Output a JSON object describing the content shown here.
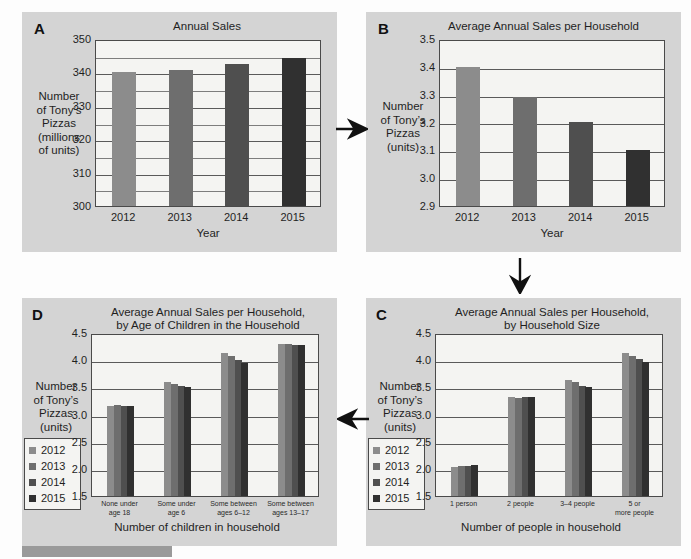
{
  "figure": {
    "background": "#fdfdfd",
    "panel_background": "#d4d4d4",
    "plot_background": "#f4f4f2",
    "series_colors": [
      "#8c8c8c",
      "#6e6e6e",
      "#4f4f4f",
      "#303030"
    ],
    "legend_years": [
      "2012",
      "2013",
      "2014",
      "2015"
    ],
    "ylabel_A": "Number\nof Tony’s\nPizzas\n(millions\nof units)",
    "ylabel_common": "Number\nof Tony’s\nPizzas\n(units)"
  },
  "panels": {
    "A": {
      "label": "A",
      "title": "Annual Sales",
      "ylabel_lines": [
        "Number",
        "of Tony’s",
        "Pizzas",
        "(millions",
        "of units)"
      ],
      "xlabel": "Year"
    },
    "B": {
      "label": "B",
      "title": "Average Annual Sales per Household",
      "ylabel_lines": [
        "Number",
        "of Tony’s",
        "Pizzas",
        "(units)"
      ],
      "xlabel": "Year"
    },
    "C": {
      "label": "C",
      "title_lines": [
        "Average Annual Sales per Household,",
        "by Household Size"
      ],
      "ylabel_lines": [
        "Number",
        "of Tony’s",
        "Pizzas",
        "(units)"
      ],
      "xlabel": "Number of people in household"
    },
    "D": {
      "label": "D",
      "title_lines": [
        "Average Annual Sales per Household,",
        "by Age of Children in the Household"
      ],
      "ylabel_lines": [
        "Number",
        "of Tony’s",
        "Pizzas",
        "(units)"
      ],
      "xlabel": "Number of children in household"
    }
  },
  "chart_data": [
    {
      "panel": "A",
      "type": "bar",
      "title": "Annual Sales",
      "xlabel": "Year",
      "ylabel": "Number of Tony's Pizzas (millions of units)",
      "categories": [
        "2012",
        "2013",
        "2014",
        "2015"
      ],
      "values": [
        340,
        340.7,
        342.4,
        344.3
      ],
      "yticks": [
        300,
        310,
        320,
        330,
        340,
        350
      ],
      "ylim": [
        300,
        350
      ],
      "grid": true,
      "legend": "none",
      "bar_colors": [
        "#8c8c8c",
        "#6e6e6e",
        "#4f4f4f",
        "#303030"
      ]
    },
    {
      "panel": "B",
      "type": "bar",
      "title": "Average Annual Sales per Household",
      "xlabel": "Year",
      "ylabel": "Number of Tony's Pizzas (units)",
      "categories": [
        "2012",
        "2013",
        "2014",
        "2015"
      ],
      "values": [
        3.4,
        3.29,
        3.2,
        3.1
      ],
      "yticks": [
        2.9,
        3.0,
        3.1,
        3.2,
        3.3,
        3.4,
        3.5
      ],
      "ytick_labels": [
        "2.9",
        "3.0",
        "3.1",
        "3.2",
        "3.3",
        "3.4",
        "3.5"
      ],
      "ylim": [
        2.9,
        3.5
      ],
      "grid": true,
      "legend": "none",
      "bar_colors": [
        "#8c8c8c",
        "#6e6e6e",
        "#4f4f4f",
        "#303030"
      ]
    },
    {
      "panel": "C",
      "type": "bar",
      "title": "Average Annual Sales per Household, by Household Size",
      "xlabel": "Number of people in household",
      "ylabel": "Number of Tony's Pizzas (units)",
      "categories": [
        "1 person",
        "2 people",
        "3–4 people",
        "5 or more people"
      ],
      "series": [
        {
          "name": "2012",
          "values": [
            2.03,
            3.32,
            3.63,
            4.13
          ]
        },
        {
          "name": "2013",
          "values": [
            2.05,
            3.31,
            3.59,
            4.08
          ]
        },
        {
          "name": "2014",
          "values": [
            2.06,
            3.32,
            3.53,
            4.02
          ]
        },
        {
          "name": "2015",
          "values": [
            2.07,
            3.33,
            3.5,
            3.96
          ]
        }
      ],
      "yticks": [
        1.5,
        2.0,
        2.5,
        3.0,
        3.5,
        4.0,
        4.5
      ],
      "ytick_labels": [
        "1.5",
        "2.0",
        "2.5",
        "3.0",
        "3.5",
        "4.0",
        "4.5"
      ],
      "ylim": [
        1.5,
        4.5
      ],
      "grid": true,
      "legend": "left-outside",
      "legend_entries": [
        "2012",
        "2013",
        "2014",
        "2015"
      ]
    },
    {
      "panel": "D",
      "type": "bar",
      "title": "Average Annual Sales per Household, by Age of Children in the Household",
      "xlabel": "Number of children in household",
      "ylabel": "Number of Tony's Pizzas (units)",
      "categories": [
        "None under age 18",
        "Some under age 6",
        "Some between ages 6–12",
        "Some between ages 13–17"
      ],
      "category_lines": [
        [
          "None under",
          "age 18"
        ],
        [
          "Some under",
          "age 6"
        ],
        [
          "Some between",
          "ages 6–12"
        ],
        [
          "Some between",
          "ages 13–17"
        ]
      ],
      "series": [
        {
          "name": "2012",
          "values": [
            3.16,
            3.59,
            4.13,
            4.29
          ]
        },
        {
          "name": "2013",
          "values": [
            3.17,
            3.56,
            4.07,
            4.29
          ]
        },
        {
          "name": "2014",
          "values": [
            3.16,
            3.53,
            4.0,
            4.28
          ]
        },
        {
          "name": "2015",
          "values": [
            3.15,
            3.51,
            3.94,
            4.27
          ]
        }
      ],
      "yticks": [
        1.5,
        2.0,
        2.5,
        3.0,
        3.5,
        4.0,
        4.5
      ],
      "ytick_labels": [
        "1.5",
        "2.0",
        "2.5",
        "3.0",
        "3.5",
        "4.0",
        "4.5"
      ],
      "ylim": [
        1.5,
        4.5
      ],
      "grid": true,
      "legend": "left-outside",
      "legend_entries": [
        "2012",
        "2013",
        "2014",
        "2015"
      ]
    }
  ],
  "arrows": [
    {
      "name": "arrow-a-to-b",
      "direction": "right"
    },
    {
      "name": "arrow-b-to-c",
      "direction": "down"
    },
    {
      "name": "arrow-c-to-d",
      "direction": "left"
    }
  ]
}
